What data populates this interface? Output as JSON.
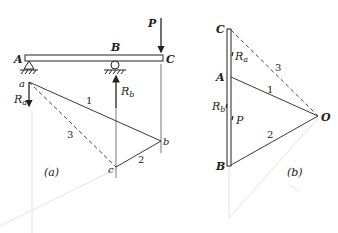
{
  "figure_a": {
    "caption": "(a)",
    "points": {
      "A": "A",
      "B": "B",
      "C": "C",
      "a": "a",
      "b": "b",
      "c": "c"
    },
    "forces": {
      "P": "P",
      "Ra": "R",
      "Ra_sub": "a",
      "Rb": "R",
      "Rb_sub": "b"
    },
    "lines": {
      "l1": "1",
      "l2": "2",
      "l3": "3"
    }
  },
  "figure_b": {
    "caption": "(b)",
    "points": {
      "C": "C",
      "A": "A",
      "B": "B",
      "O": "O"
    },
    "forces": {
      "Ra": "R",
      "Ra_sub": "a",
      "Rb": "R",
      "Rb_sub": "b",
      "P": "P"
    },
    "rays": {
      "r1": "1",
      "r2": "2",
      "r3": "3"
    }
  },
  "colors": {
    "ink": "#222222",
    "faint": "#dcdcdc"
  }
}
